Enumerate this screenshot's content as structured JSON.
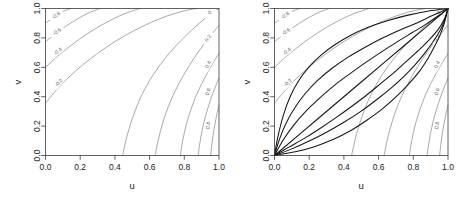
{
  "figure": {
    "panel_count": 2,
    "background": "#ffffff"
  },
  "axes": {
    "xlabel": "u",
    "ylabel": "v",
    "xticks": [
      "0.0",
      "0.2",
      "0.4",
      "0.6",
      "0.8",
      "1.0"
    ],
    "yticks": [
      "0.0",
      "0.2",
      "0.4",
      "0.6",
      "0.8",
      "1.0"
    ],
    "xlim": [
      0,
      1
    ],
    "ylim": [
      0,
      1
    ],
    "box_color": "#3a3a3a"
  },
  "contour_color": "#8c8c8c",
  "overlay_color": "#151515",
  "labels": {
    "l_m08": "-0.8",
    "l_m06": "-0.6",
    "l_m04": "-0.4",
    "l_m02": "-0.2",
    "l_0": "0",
    "l_02": "0.2",
    "l_04": "0.4",
    "l_06": "0.6",
    "l_08": "0.8"
  },
  "chart_data": [
    {
      "type": "line",
      "panel": "left",
      "title": "",
      "xlabel": "u",
      "ylabel": "v",
      "xlim": [
        0,
        1
      ],
      "ylim": [
        0,
        1
      ],
      "grid": false,
      "legend": "none",
      "description": "Contour plot of level curves on the unit square, levels from -0.8 to 0.8",
      "levels": [
        -0.8,
        -0.6,
        -0.4,
        -0.2,
        0,
        0.2,
        0.4,
        0.6,
        0.8
      ],
      "level_labels": [
        "-0.8",
        "-0.6",
        "-0.4",
        "-0.2",
        "0",
        "0.2",
        "0.4",
        "0.6",
        "0.8"
      ],
      "series": [
        {
          "name": "-0.8",
          "label_at": [
            0.06,
            0.955
          ],
          "points": [
            [
              0.0,
              0.9
            ],
            [
              0.03,
              0.925
            ],
            [
              0.06,
              0.95
            ],
            [
              0.09,
              0.972
            ],
            [
              0.12,
              0.99
            ],
            [
              0.145,
              1.0
            ]
          ]
        },
        {
          "name": "-0.6",
          "label_at": [
            0.065,
            0.845
          ],
          "points": [
            [
              0.0,
              0.775
            ],
            [
              0.04,
              0.812
            ],
            [
              0.08,
              0.848
            ],
            [
              0.12,
              0.882
            ],
            [
              0.16,
              0.912
            ],
            [
              0.2,
              0.94
            ],
            [
              0.24,
              0.965
            ],
            [
              0.28,
              0.985
            ],
            [
              0.315,
              1.0
            ]
          ]
        },
        {
          "name": "-0.4",
          "label_at": [
            0.07,
            0.71
          ],
          "points": [
            [
              0.0,
              0.6
            ],
            [
              0.05,
              0.655
            ],
            [
              0.1,
              0.705
            ],
            [
              0.15,
              0.752
            ],
            [
              0.2,
              0.795
            ],
            [
              0.25,
              0.835
            ],
            [
              0.3,
              0.872
            ],
            [
              0.35,
              0.905
            ],
            [
              0.4,
              0.935
            ],
            [
              0.45,
              0.962
            ],
            [
              0.5,
              0.983
            ],
            [
              0.545,
              1.0
            ]
          ]
        },
        {
          "name": "-0.2",
          "label_at": [
            0.075,
            0.497
          ],
          "points": [
            [
              0.0,
              0.355
            ],
            [
              0.05,
              0.428
            ],
            [
              0.1,
              0.492
            ],
            [
              0.15,
              0.55
            ],
            [
              0.2,
              0.602
            ],
            [
              0.25,
              0.65
            ],
            [
              0.3,
              0.695
            ],
            [
              0.35,
              0.736
            ],
            [
              0.4,
              0.775
            ],
            [
              0.45,
              0.81
            ],
            [
              0.5,
              0.843
            ],
            [
              0.55,
              0.873
            ],
            [
              0.6,
              0.901
            ],
            [
              0.65,
              0.926
            ],
            [
              0.7,
              0.949
            ],
            [
              0.75,
              0.968
            ],
            [
              0.8,
              0.984
            ],
            [
              0.85,
              0.996
            ],
            [
              0.875,
              1.0
            ]
          ]
        },
        {
          "name": "0",
          "label_at": [
            0.945,
            0.975
          ],
          "points": [
            [
              0.445,
              0.0
            ],
            [
              0.46,
              0.085
            ],
            [
              0.48,
              0.175
            ],
            [
              0.5,
              0.25
            ],
            [
              0.53,
              0.345
            ],
            [
              0.56,
              0.423
            ],
            [
              0.6,
              0.51
            ],
            [
              0.64,
              0.583
            ],
            [
              0.68,
              0.647
            ],
            [
              0.72,
              0.704
            ],
            [
              0.76,
              0.757
            ],
            [
              0.8,
              0.805
            ],
            [
              0.84,
              0.85
            ],
            [
              0.88,
              0.893
            ],
            [
              0.92,
              0.933
            ],
            [
              0.96,
              0.969
            ],
            [
              1.0,
              1.0
            ]
          ]
        },
        {
          "name": "0.2",
          "label_at": [
            0.935,
            0.8
          ],
          "points": [
            [
              0.632,
              0.0
            ],
            [
              0.645,
              0.08
            ],
            [
              0.662,
              0.165
            ],
            [
              0.683,
              0.25
            ],
            [
              0.708,
              0.332
            ],
            [
              0.735,
              0.408
            ],
            [
              0.765,
              0.48
            ],
            [
              0.795,
              0.545
            ],
            [
              0.825,
              0.605
            ],
            [
              0.855,
              0.66
            ],
            [
              0.885,
              0.712
            ],
            [
              0.915,
              0.76
            ],
            [
              0.945,
              0.806
            ],
            [
              0.975,
              0.85
            ],
            [
              1.0,
              0.885
            ]
          ]
        },
        {
          "name": "0.4",
          "label_at": [
            0.935,
            0.62
          ],
          "points": [
            [
              0.777,
              0.0
            ],
            [
              0.787,
              0.075
            ],
            [
              0.8,
              0.155
            ],
            [
              0.817,
              0.235
            ],
            [
              0.838,
              0.313
            ],
            [
              0.861,
              0.386
            ],
            [
              0.886,
              0.453
            ],
            [
              0.912,
              0.515
            ],
            [
              0.938,
              0.572
            ],
            [
              0.963,
              0.624
            ],
            [
              0.988,
              0.672
            ],
            [
              1.0,
              0.694
            ]
          ]
        },
        {
          "name": "0.6",
          "label_at": [
            0.935,
            0.435
          ],
          "points": [
            [
              0.88,
              0.0
            ],
            [
              0.888,
              0.073
            ],
            [
              0.899,
              0.15
            ],
            [
              0.913,
              0.226
            ],
            [
              0.93,
              0.299
            ],
            [
              0.948,
              0.367
            ],
            [
              0.967,
              0.43
            ],
            [
              0.986,
              0.487
            ],
            [
              1.0,
              0.525
            ]
          ]
        },
        {
          "name": "0.8",
          "label_at": [
            0.935,
            0.205
          ],
          "points": [
            [
              0.952,
              0.0
            ],
            [
              0.958,
              0.068
            ],
            [
              0.966,
              0.14
            ],
            [
              0.976,
              0.21
            ],
            [
              0.987,
              0.276
            ],
            [
              0.999,
              0.338
            ],
            [
              1.0,
              0.343
            ]
          ]
        }
      ]
    },
    {
      "type": "line",
      "panel": "right",
      "title": "",
      "xlabel": "u",
      "ylabel": "v",
      "xlim": [
        0,
        1
      ],
      "ylim": [
        0,
        1
      ],
      "grid": false,
      "legend": "none",
      "description": "Same contour levels as left panel with overlaid dark copula diagonal-section curves joining (0,0) to (1,1)",
      "levels": [
        -0.8,
        -0.6,
        -0.4,
        -0.2,
        0,
        0.2,
        0.4,
        0.6,
        0.8
      ],
      "overlay_curves": [
        {
          "name": "upper-outer",
          "points": [
            [
              0.0,
              0.0
            ],
            [
              0.02,
              0.13
            ],
            [
              0.05,
              0.27
            ],
            [
              0.09,
              0.4
            ],
            [
              0.14,
              0.51
            ],
            [
              0.2,
              0.605
            ],
            [
              0.27,
              0.685
            ],
            [
              0.35,
              0.755
            ],
            [
              0.44,
              0.818
            ],
            [
              0.54,
              0.872
            ],
            [
              0.65,
              0.917
            ],
            [
              0.77,
              0.955
            ],
            [
              0.89,
              0.983
            ],
            [
              1.0,
              1.0
            ]
          ]
        },
        {
          "name": "upper-mid",
          "points": [
            [
              0.0,
              0.0
            ],
            [
              0.03,
              0.115
            ],
            [
              0.07,
              0.228
            ],
            [
              0.12,
              0.33
            ],
            [
              0.18,
              0.425
            ],
            [
              0.25,
              0.512
            ],
            [
              0.33,
              0.592
            ],
            [
              0.42,
              0.666
            ],
            [
              0.52,
              0.735
            ],
            [
              0.62,
              0.797
            ],
            [
              0.72,
              0.852
            ],
            [
              0.82,
              0.902
            ],
            [
              0.91,
              0.952
            ],
            [
              1.0,
              1.0
            ]
          ]
        },
        {
          "name": "upper-inner",
          "points": [
            [
              0.0,
              0.0
            ],
            [
              0.05,
              0.105
            ],
            [
              0.11,
              0.205
            ],
            [
              0.18,
              0.3
            ],
            [
              0.26,
              0.39
            ],
            [
              0.34,
              0.472
            ],
            [
              0.43,
              0.552
            ],
            [
              0.52,
              0.628
            ],
            [
              0.61,
              0.7
            ],
            [
              0.7,
              0.768
            ],
            [
              0.79,
              0.833
            ],
            [
              0.87,
              0.89
            ],
            [
              0.94,
              0.947
            ],
            [
              1.0,
              1.0
            ]
          ]
        },
        {
          "name": "diagonal",
          "points": [
            [
              0.0,
              0.0
            ],
            [
              0.25,
              0.25
            ],
            [
              0.5,
              0.5
            ],
            [
              0.75,
              0.75
            ],
            [
              1.0,
              1.0
            ]
          ]
        },
        {
          "name": "lower-inner",
          "points": [
            [
              0.0,
              0.0
            ],
            [
              0.08,
              0.055
            ],
            [
              0.17,
              0.115
            ],
            [
              0.26,
              0.182
            ],
            [
              0.35,
              0.254
            ],
            [
              0.44,
              0.33
            ],
            [
              0.53,
              0.41
            ],
            [
              0.61,
              0.487
            ],
            [
              0.69,
              0.565
            ],
            [
              0.76,
              0.64
            ],
            [
              0.83,
              0.715
            ],
            [
              0.89,
              0.785
            ],
            [
              0.945,
              0.86
            ],
            [
              0.98,
              0.93
            ],
            [
              1.0,
              1.0
            ]
          ]
        },
        {
          "name": "lower-mid",
          "points": [
            [
              0.0,
              0.0
            ],
            [
              0.1,
              0.045
            ],
            [
              0.2,
              0.098
            ],
            [
              0.3,
              0.158
            ],
            [
              0.4,
              0.226
            ],
            [
              0.5,
              0.302
            ],
            [
              0.59,
              0.381
            ],
            [
              0.67,
              0.457
            ],
            [
              0.745,
              0.537
            ],
            [
              0.81,
              0.617
            ],
            [
              0.865,
              0.695
            ],
            [
              0.915,
              0.775
            ],
            [
              0.955,
              0.852
            ],
            [
              0.982,
              0.925
            ],
            [
              1.0,
              1.0
            ]
          ]
        },
        {
          "name": "lower-outer",
          "points": [
            [
              0.0,
              0.0
            ],
            [
              0.12,
              0.025
            ],
            [
              0.23,
              0.06
            ],
            [
              0.34,
              0.11
            ],
            [
              0.44,
              0.17
            ],
            [
              0.53,
              0.238
            ],
            [
              0.62,
              0.315
            ],
            [
              0.7,
              0.398
            ],
            [
              0.77,
              0.482
            ],
            [
              0.835,
              0.572
            ],
            [
              0.885,
              0.662
            ],
            [
              0.925,
              0.748
            ],
            [
              0.958,
              0.83
            ],
            [
              0.982,
              0.915
            ],
            [
              1.0,
              1.0
            ]
          ]
        }
      ]
    }
  ]
}
